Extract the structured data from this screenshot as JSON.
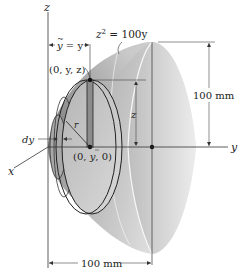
{
  "diagram": {
    "type": "paraboloid-volume-element",
    "axes": {
      "z_label": "z",
      "y_label": "y",
      "x_label": "x"
    },
    "equation_label": "z² = 100y",
    "equation": {
      "base": "z",
      "sup": "2",
      "rest": " = 100y"
    },
    "centroid_label": "ỹ = y",
    "centroid": {
      "sym": "y",
      "bar": "~",
      "rest": " = y"
    },
    "point_top_label": "(0, y, z)",
    "point_center_label": "(0, ȳ, 0)",
    "point_center": {
      "open": "(0, ",
      "sym": "y",
      "close": ", 0)"
    },
    "dimension_vertical": "100 mm",
    "dimension_horizontal": "100 mm",
    "element_labels": {
      "thickness": "dy",
      "radius": "r",
      "height": "z"
    },
    "colors": {
      "surface_dark": "#8a8a8a",
      "surface_light": "#e4e4e4",
      "line": "#222222"
    }
  }
}
